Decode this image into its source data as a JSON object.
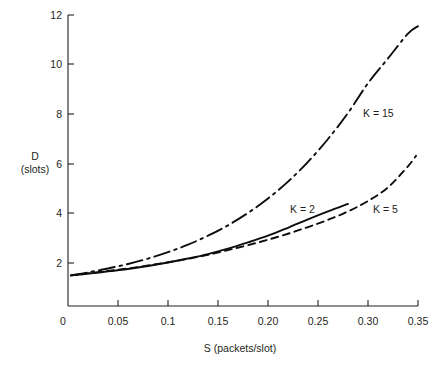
{
  "chart_data": {
    "type": "line",
    "title": "",
    "xlabel": "S (packets/slot)",
    "ylabel": "D\n(slots)",
    "ylabel_line1": "D",
    "ylabel_line2": "(slots)",
    "xlim": [
      0,
      0.35
    ],
    "ylim": [
      0,
      12
    ],
    "grid": false,
    "legend_position": "inline-annotations",
    "xticks": [
      0,
      0.05,
      0.1,
      0.15,
      0.2,
      0.25,
      0.3,
      0.35
    ],
    "xticklabels": [
      "0",
      "0.05",
      "0.1",
      "0.15",
      "0.20",
      "0.25",
      "0.30",
      "0.35"
    ],
    "yticks": [
      2,
      4,
      6,
      8,
      10,
      12
    ],
    "yticklabels": [
      "2",
      "4",
      "6",
      "8",
      "10",
      "12"
    ],
    "y_origin_label": "0",
    "series": [
      {
        "name": "K = 2",
        "style": "solid",
        "label_x": 0.222,
        "label_y": 4.17,
        "x": [
          0.003,
          0.02,
          0.04,
          0.06,
          0.08,
          0.1,
          0.12,
          0.14,
          0.16,
          0.18,
          0.2,
          0.22,
          0.24,
          0.26,
          0.28
        ],
        "y": [
          1.5,
          1.57,
          1.66,
          1.76,
          1.88,
          2.02,
          2.18,
          2.36,
          2.58,
          2.83,
          3.1,
          3.42,
          3.76,
          4.08,
          4.38
        ]
      },
      {
        "name": "K = 5",
        "style": "dashed",
        "label_x": 0.305,
        "label_y": 4.17,
        "x": [
          0.003,
          0.02,
          0.04,
          0.06,
          0.08,
          0.1,
          0.12,
          0.14,
          0.16,
          0.18,
          0.2,
          0.22,
          0.24,
          0.26,
          0.28,
          0.3,
          0.32,
          0.34,
          0.348
        ],
        "y": [
          1.5,
          1.58,
          1.68,
          1.78,
          1.9,
          2.03,
          2.17,
          2.33,
          2.52,
          2.72,
          2.94,
          3.18,
          3.45,
          3.74,
          4.08,
          4.5,
          5.05,
          5.9,
          6.32
        ]
      },
      {
        "name": "K = 15",
        "style": "dash-dot",
        "label_x": 0.295,
        "label_y": 8.05,
        "x": [
          0.003,
          0.02,
          0.04,
          0.06,
          0.08,
          0.1,
          0.12,
          0.14,
          0.16,
          0.18,
          0.2,
          0.22,
          0.24,
          0.26,
          0.28,
          0.3,
          0.32,
          0.34,
          0.35
        ],
        "y": [
          1.5,
          1.62,
          1.78,
          1.96,
          2.18,
          2.44,
          2.74,
          3.1,
          3.52,
          4.02,
          4.6,
          5.28,
          6.08,
          7.0,
          8.05,
          9.25,
          10.25,
          11.25,
          11.55
        ]
      }
    ]
  },
  "axes": {
    "x_title": "S (packets/slot)",
    "y_title_line1": "D",
    "y_title_line2": "(slots)",
    "origin_label": "0"
  },
  "labels": {
    "k2": "K = 2",
    "k5": "K = 5",
    "k15": "K = 15"
  },
  "colors": {
    "ink": "#231f20",
    "background": "#ffffff"
  }
}
